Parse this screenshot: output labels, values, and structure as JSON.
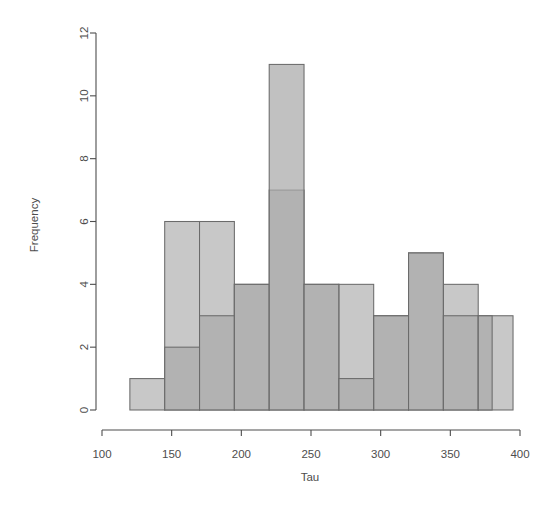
{
  "chart_data": {
    "type": "bar",
    "subtype": "overlaid-histogram",
    "title": "",
    "xlabel": "Tau",
    "ylabel": "Frequency",
    "xlim": [
      100,
      400
    ],
    "ylim": [
      0,
      12
    ],
    "xticks": [
      100,
      150,
      200,
      250,
      300,
      350,
      400
    ],
    "xtick_labels": [
      "100",
      "150",
      "200",
      "250",
      "300",
      "350",
      "400"
    ],
    "yticks": [
      0,
      2,
      4,
      6,
      8,
      10,
      12
    ],
    "ytick_labels": [
      "0",
      "2",
      "4",
      "6",
      "8",
      "10",
      "12"
    ],
    "grid": false,
    "legend": null,
    "bin_width": 25,
    "series": [
      {
        "name": "series-light",
        "color": "#c8c8c8",
        "edge_color": "#6b6b6b",
        "bin_edges": [
          120,
          145,
          170,
          195,
          220,
          245,
          270,
          295,
          320,
          345,
          370,
          395
        ],
        "bins": [
          {
            "x0": 120,
            "x1": 145,
            "value": 1
          },
          {
            "x0": 145,
            "x1": 170,
            "value": 6
          },
          {
            "x0": 170,
            "x1": 195,
            "value": 6
          },
          {
            "x0": 195,
            "x1": 220,
            "value": 4
          },
          {
            "x0": 220,
            "x1": 245,
            "value": 7
          },
          {
            "x0": 245,
            "x1": 270,
            "value": 4
          },
          {
            "x0": 270,
            "x1": 295,
            "value": 4
          },
          {
            "x0": 295,
            "x1": 320,
            "value": 3
          },
          {
            "x0": 320,
            "x1": 345,
            "value": 5
          },
          {
            "x0": 345,
            "x1": 370,
            "value": 4
          },
          {
            "x0": 370,
            "x1": 395,
            "value": 3
          }
        ]
      },
      {
        "name": "series-dark",
        "color": "#a8a8a8",
        "edge_color": "#6b6b6b",
        "opacity": 0.72,
        "bin_edges": [
          145,
          170,
          195,
          220,
          245,
          270,
          295,
          320,
          345,
          370,
          380
        ],
        "bins": [
          {
            "x0": 145,
            "x1": 170,
            "value": 2
          },
          {
            "x0": 170,
            "x1": 195,
            "value": 3
          },
          {
            "x0": 195,
            "x1": 220,
            "value": 4
          },
          {
            "x0": 220,
            "x1": 245,
            "value": 11
          },
          {
            "x0": 245,
            "x1": 270,
            "value": 4
          },
          {
            "x0": 270,
            "x1": 295,
            "value": 1
          },
          {
            "x0": 295,
            "x1": 320,
            "value": 3
          },
          {
            "x0": 320,
            "x1": 345,
            "value": 5
          },
          {
            "x0": 345,
            "x1": 370,
            "value": 3
          },
          {
            "x0": 370,
            "x1": 380,
            "value": 3
          }
        ]
      }
    ],
    "colors": {
      "background": "#ffffff",
      "axis": "#4d4d4d",
      "bar_light": "#c8c8c8",
      "bar_dark": "#a9a9a9",
      "bar_overlap": "#9b9b9b",
      "bar_edge": "#6b6b6b"
    }
  },
  "plot": {
    "x_axis_title": "Tau",
    "y_axis_title": "Frequency"
  }
}
